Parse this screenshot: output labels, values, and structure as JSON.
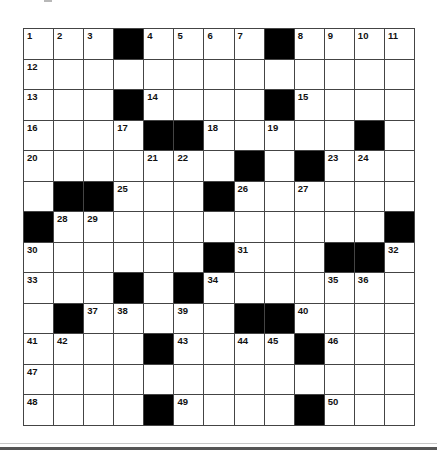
{
  "puzzle": {
    "rows": 13,
    "cols": 13,
    "grid": [
      [
        "1",
        "2",
        "3",
        "#",
        "4",
        "5",
        "6",
        "7",
        "#",
        "8",
        "9",
        "10",
        "11"
      ],
      [
        "12",
        "",
        "",
        "",
        "",
        "",
        "",
        "",
        "",
        "",
        "",
        "",
        ""
      ],
      [
        "13",
        "",
        "",
        "#",
        "14",
        "",
        "",
        "",
        "#",
        "15",
        "",
        "",
        ""
      ],
      [
        "16",
        "",
        "",
        "17",
        "#",
        "#",
        "18",
        "",
        "19",
        "",
        "",
        "#",
        ""
      ],
      [
        "20",
        "",
        "",
        "",
        "21",
        "22",
        "",
        "#",
        "",
        "#",
        "23",
        "24",
        ""
      ],
      [
        "",
        "#",
        "#",
        "25",
        "",
        "",
        "#",
        "26",
        "",
        "27",
        "",
        "",
        ""
      ],
      [
        "#",
        "28",
        "29",
        "",
        "",
        "",
        "",
        "",
        "",
        "",
        "",
        "",
        "#"
      ],
      [
        "30",
        "",
        "",
        "",
        "",
        "",
        "#",
        "31",
        "",
        "",
        "#",
        "#",
        "32"
      ],
      [
        "33",
        "",
        "",
        "#",
        "",
        "#",
        "34",
        "",
        "",
        "",
        "35",
        "36",
        ""
      ],
      [
        "",
        "#",
        "37",
        "38",
        "",
        "39",
        "",
        "#",
        "#",
        "40",
        "",
        "",
        ""
      ],
      [
        "41",
        "42",
        "",
        "",
        "#",
        "43",
        "",
        "44",
        "45",
        "#",
        "46",
        "",
        ""
      ],
      [
        "47",
        "",
        "",
        "",
        "",
        "",
        "",
        "",
        "",
        "",
        "",
        "",
        ""
      ],
      [
        "48",
        "",
        "",
        "",
        "#",
        "49",
        "",
        "",
        "",
        "#",
        "50",
        "",
        ""
      ]
    ]
  },
  "colors": {
    "block": "#000000",
    "cell": "#ffffff",
    "grid_line": "#444444"
  }
}
